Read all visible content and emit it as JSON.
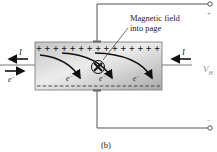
{
  "diagram": {
    "caption": "(b)",
    "field_label_line1": "Magnetic field",
    "field_label_line2": "into page",
    "current_label_left": "I",
    "current_label_right": "I",
    "electron_label_left": "e",
    "electron_superscript": "−",
    "electron_labels": [
      "e",
      "e",
      "e"
    ],
    "voltage_label": "V",
    "voltage_subscript": "H",
    "terminal_positive": "+",
    "terminal_negative": "−",
    "plus_row": "+++++++++++++++",
    "field_symbol": "×",
    "colors": {
      "wire": "#555555",
      "block_light": "#e6e6e6",
      "block_dark": "#a8a8a8",
      "arrow": "#111111",
      "label_gray": "#888888"
    }
  }
}
